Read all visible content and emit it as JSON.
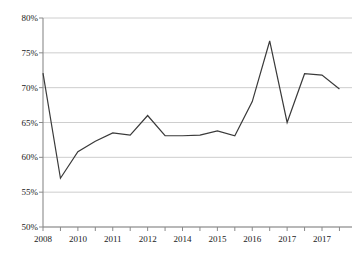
{
  "chart_data": {
    "type": "line",
    "title": "",
    "xlabel": "",
    "ylabel": "",
    "ylim": [
      50,
      80
    ],
    "ytick_values": [
      50,
      55,
      60,
      65,
      70,
      75,
      80
    ],
    "ytick_labels": [
      "50%",
      "55%",
      "60%",
      "65%",
      "70%",
      "75%",
      "80%"
    ],
    "grid": true,
    "grid_axis": "y",
    "legend": false,
    "legend_position": "none",
    "line_color": "#3a3a3a",
    "grid_color": "#c8c8c8",
    "axis_color": "#8a8a8a",
    "x_tick_count": 18,
    "xtick_labels": [
      "2008",
      "",
      "2010",
      "",
      "2011",
      "",
      "2012",
      "",
      "2014",
      "",
      "2015",
      "",
      "2016",
      "",
      "2017",
      "",
      "2017",
      ""
    ],
    "xtick_labels_shown": [
      "2008",
      "2010",
      "2011",
      "2012",
      "2014",
      "2015",
      "2016",
      "2017",
      "2017"
    ],
    "categories": [
      "2008",
      "2009",
      "2010",
      "2010",
      "2011",
      "2011",
      "2012",
      "2013",
      "2014",
      "2014",
      "2015",
      "2015",
      "2016",
      "2016",
      "2017",
      "2017",
      "2017",
      "2017"
    ],
    "values": [
      72.1,
      57.0,
      60.8,
      62.3,
      63.5,
      63.2,
      66.0,
      63.1,
      63.1,
      63.2,
      63.8,
      63.1,
      68.0,
      76.7,
      65.0,
      72.0,
      71.8,
      69.8
    ],
    "series": [
      {
        "name": "series-1",
        "values": [
          72.1,
          57.0,
          60.8,
          62.3,
          63.5,
          63.2,
          66.0,
          63.1,
          63.1,
          63.2,
          63.8,
          63.1,
          68.0,
          76.7,
          65.0,
          72.0,
          71.8,
          69.8
        ]
      }
    ]
  }
}
